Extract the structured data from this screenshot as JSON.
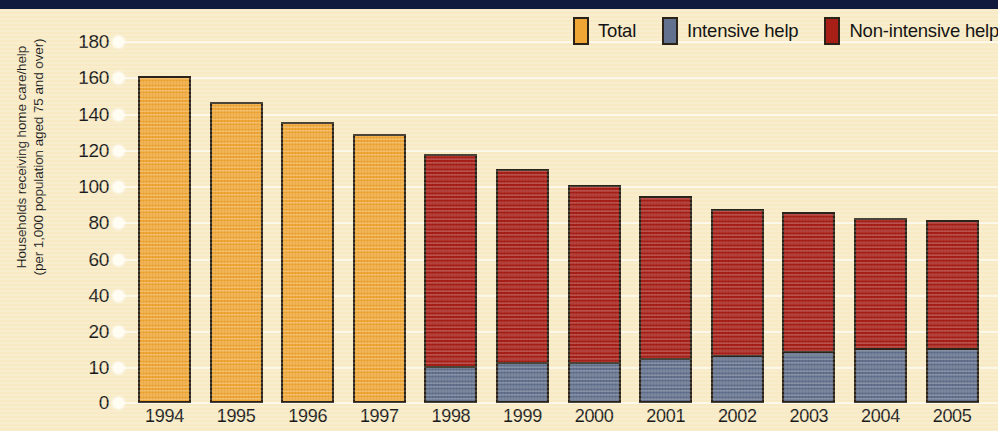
{
  "chart_data": {
    "type": "bar",
    "stacked": true,
    "title": "",
    "xlabel": "",
    "ylabel": "Households receiving home care/help (per 1,000 population aged 75 and over)",
    "ylabel_lines": [
      "Households receiving home care/help",
      "(per 1,000 population aged 75 and over)"
    ],
    "categories": [
      "1994",
      "1995",
      "1996",
      "1997",
      "1998",
      "1999",
      "2000",
      "2001",
      "2002",
      "2003",
      "2004",
      "2005"
    ],
    "ytick_labels": [
      "180",
      "160",
      "140",
      "120",
      "100",
      "80",
      "60",
      "40",
      "20",
      "10",
      "0"
    ],
    "ytick_values": [
      180,
      160,
      140,
      120,
      100,
      80,
      60,
      40,
      20,
      10,
      0
    ],
    "ylim": [
      0,
      190
    ],
    "grid": true,
    "grid_orientation": "horizontal",
    "legend_position": "top-right",
    "series": [
      {
        "name": "Total",
        "color": "#f0a635",
        "values": [
          161,
          147,
          136,
          129,
          null,
          null,
          null,
          null,
          null,
          null,
          null,
          null
        ]
      },
      {
        "name": "Intensive help",
        "color": "#62718d",
        "values": [
          null,
          null,
          null,
          null,
          10,
          11,
          11,
          12,
          13,
          14,
          15,
          15
        ]
      },
      {
        "name": "Non-intensive help",
        "color": "#a81f18",
        "values": [
          null,
          null,
          null,
          null,
          108,
          99,
          90,
          83,
          75,
          72,
          68,
          67
        ]
      }
    ],
    "totals": [
      161,
      147,
      136,
      129,
      118,
      110,
      101,
      95,
      88,
      86,
      83,
      82
    ]
  },
  "legend": {
    "items": [
      {
        "label": "Total",
        "swatch": "total"
      },
      {
        "label": "Intensive help",
        "swatch": "intensive"
      },
      {
        "label": "Non-intensive help",
        "swatch": "nonintensive"
      }
    ]
  },
  "colors": {
    "background": "#f7eac4",
    "top_band": "#101a3c",
    "total": "#f0a635",
    "intensive": "#62718d",
    "nonintensive": "#a81f18",
    "outline": "#2b2317",
    "gridline": "#ffffff",
    "text": "#1a1a1a"
  }
}
